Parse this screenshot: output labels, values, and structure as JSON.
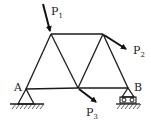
{
  "diagram": {
    "type": "truss",
    "nodes": {
      "A": {
        "label": "A",
        "x": 26,
        "y": 89
      },
      "C": {
        "x": 51,
        "y": 34
      },
      "D": {
        "x": 103,
        "y": 34
      },
      "E": {
        "x": 78,
        "y": 88
      },
      "B": {
        "label": "B",
        "x": 128,
        "y": 88
      }
    },
    "members": [
      [
        "A",
        "C"
      ],
      [
        "C",
        "D"
      ],
      [
        "C",
        "E"
      ],
      [
        "E",
        "D"
      ],
      [
        "D",
        "B"
      ],
      [
        "A",
        "E"
      ],
      [
        "E",
        "B"
      ]
    ],
    "supports": [
      {
        "node": "A",
        "type": "pin"
      },
      {
        "node": "B",
        "type": "roller"
      }
    ],
    "loads": [
      {
        "name": "P",
        "sub": "1",
        "node": "C",
        "direction": "down-right, steep"
      },
      {
        "name": "P",
        "sub": "2",
        "node": "D",
        "direction": "down-right"
      },
      {
        "name": "P",
        "sub": "3",
        "node": "E",
        "direction": "down-right"
      }
    ],
    "labels": {
      "A": "A",
      "B": "B",
      "P1_main": "P",
      "P1_sub": "1",
      "P2_main": "P",
      "P2_sub": "2",
      "P3_main": "P",
      "P3_sub": "3"
    }
  }
}
